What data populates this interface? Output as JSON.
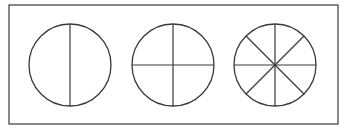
{
  "diagram": {
    "stroke_color": "#3a3a3a",
    "frame": {
      "x": 9,
      "y": 5,
      "width": 329,
      "height": 119
    },
    "circles": [
      {
        "name": "circle-halves",
        "cx": 70,
        "cy": 65,
        "r": 41,
        "parts": 2,
        "start_angle": 90
      },
      {
        "name": "circle-quarters",
        "cx": 173,
        "cy": 65,
        "r": 41,
        "parts": 4,
        "start_angle": 0
      },
      {
        "name": "circle-eighths",
        "cx": 275,
        "cy": 65,
        "r": 41,
        "parts": 8,
        "start_angle": 0
      }
    ]
  }
}
